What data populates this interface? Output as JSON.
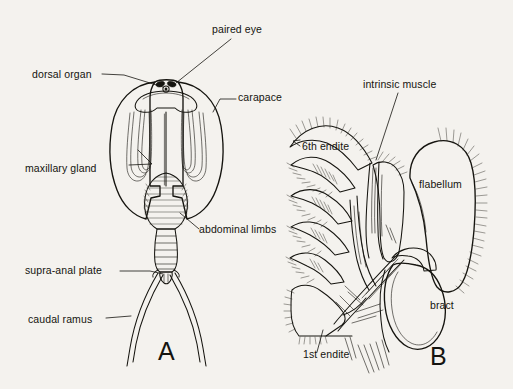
{
  "figure": {
    "background_color": "#f4f2ee",
    "ink_color": "#15140f",
    "panels": [
      {
        "letter": "A",
        "name": "dorsal-view",
        "description": "Dorsal view of whole animal showing carapace, paired eye, dorsal organ, maxillary gland, abdominal limbs, supra-anal plate and caudal rami"
      },
      {
        "letter": "B",
        "name": "limb-detail",
        "description": "Detail of trunk limb showing endites, intrinsic muscle, flabellum and bract"
      }
    ],
    "labels_a": [
      {
        "id": "paired-eye",
        "text": "paired eye",
        "x": 212,
        "y": 33
      },
      {
        "id": "dorsal-organ",
        "text": "dorsal organ",
        "x": 32,
        "y": 78
      },
      {
        "id": "carapace",
        "text": "carapace",
        "x": 238,
        "y": 101
      },
      {
        "id": "maxillary-gland",
        "text": "maxillary gland",
        "x": 25,
        "y": 172
      },
      {
        "id": "abdominal-limbs",
        "text": "abdominal limbs",
        "x": 199,
        "y": 233
      },
      {
        "id": "supra-anal-plate",
        "text": "supra-anal plate",
        "x": 25,
        "y": 274
      },
      {
        "id": "caudal-ramus",
        "text": "caudal ramus",
        "x": 28,
        "y": 323
      }
    ],
    "labels_b": [
      {
        "id": "intrinsic-muscle",
        "text": "intrinsic muscle",
        "x": 363,
        "y": 88
      },
      {
        "id": "sixth-endite",
        "text": "6th endite",
        "x": 302,
        "y": 150
      },
      {
        "id": "flabellum",
        "text": "flabellum",
        "x": 419,
        "y": 188
      },
      {
        "id": "bract",
        "text": "bract",
        "x": 430,
        "y": 309
      },
      {
        "id": "first-endite",
        "text": "1st endite",
        "x": 303,
        "y": 358
      }
    ],
    "panel_letters": [
      {
        "id": "panel-letter-a",
        "text": "A",
        "x": 158,
        "y": 360
      },
      {
        "id": "panel-letter-b",
        "text": "B",
        "x": 430,
        "y": 365
      }
    ]
  }
}
